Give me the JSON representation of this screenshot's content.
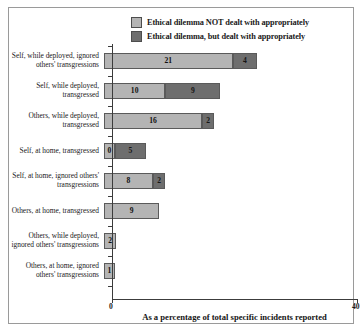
{
  "chart_data": {
    "type": "bar",
    "orientation": "horizontal",
    "stacked": true,
    "title": "",
    "xlabel": "As a percentage of total specific incidents reported",
    "ylabel": "",
    "xlim": [
      0,
      40
    ],
    "xticks": [
      "0",
      "40"
    ],
    "grid": false,
    "legend_position": "top-center",
    "categories": [
      "Self, while deployed, ignored others' transgressions",
      "Self, while deployed, transgressed",
      "Others, while deployed, transgressed",
      "Self, at home, transgressed",
      "Self, at home, ignored others' transgressions",
      "Others, at home, transgressed",
      "Others, while deployed, ignored others' transgressions",
      "Others, at home, ignored others' transgressions"
    ],
    "series": [
      {
        "name": "Ethical dilemma NOT dealt with appropriately",
        "color": "#b4b4b4",
        "values": [
          21,
          10,
          16,
          0,
          8,
          9,
          2,
          1
        ]
      },
      {
        "name": "Ethical dilemma, but dealt with appropriately",
        "color": "#6e6e6e",
        "values": [
          4,
          9,
          2,
          5,
          2,
          0,
          0,
          0
        ]
      }
    ]
  },
  "legend": {
    "items": [
      {
        "label": "Ethical dilemma NOT dealt with appropriately",
        "swatch": "light-gray-swatch"
      },
      {
        "label": "Ethical dilemma, but dealt with appropriately",
        "swatch": "dark-gray-swatch"
      }
    ]
  }
}
